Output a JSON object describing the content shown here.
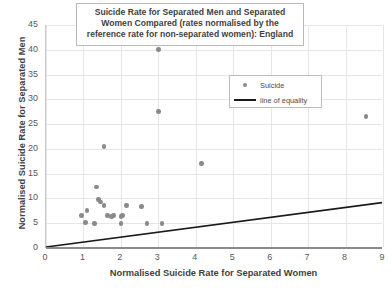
{
  "chart_data": {
    "type": "scatter",
    "title": "Suicide Rate for Separated Men and Separated Women Compared (rates normalised by the reference rate for non-separated women): England",
    "xlabel": "Normalised Suicide Rate for Separated Women",
    "ylabel": "Normalised Suicide Rate for Separated Men",
    "xlim": [
      0,
      9
    ],
    "ylim": [
      0,
      45
    ],
    "xticks": [
      0,
      1,
      2,
      3,
      4,
      5,
      6,
      7,
      8,
      9
    ],
    "yticks": [
      0,
      5,
      10,
      15,
      20,
      25,
      30,
      35,
      40,
      45
    ],
    "grid": true,
    "legend_position": "upper-right-inside",
    "series": [
      {
        "name": "Suicide",
        "type": "scatter",
        "color": "#8a8a8a",
        "points": [
          [
            3.0,
            40.0
          ],
          [
            3.0,
            27.5
          ],
          [
            8.55,
            26.5
          ],
          [
            4.15,
            17.0
          ],
          [
            1.55,
            20.5
          ],
          [
            1.35,
            12.3
          ],
          [
            1.4,
            9.8
          ],
          [
            1.45,
            9.3
          ],
          [
            1.55,
            8.6
          ],
          [
            2.15,
            8.6
          ],
          [
            2.55,
            8.4
          ],
          [
            1.1,
            7.6
          ],
          [
            0.95,
            6.5
          ],
          [
            1.05,
            5.2
          ],
          [
            1.65,
            6.6
          ],
          [
            1.75,
            6.3
          ],
          [
            1.8,
            6.5
          ],
          [
            2.0,
            6.4
          ],
          [
            2.05,
            6.6
          ],
          [
            1.3,
            5.0
          ],
          [
            2.0,
            4.9
          ],
          [
            2.7,
            4.9
          ],
          [
            3.1,
            5.0
          ]
        ]
      },
      {
        "name": "line of equality",
        "type": "line",
        "color": "#1a1a1a",
        "points": [
          [
            0,
            0
          ],
          [
            9,
            9
          ]
        ]
      }
    ]
  },
  "legend": {
    "items": [
      {
        "label": "Suicide",
        "marker": "dot-marker-icon"
      },
      {
        "label": "line of equality",
        "marker": "line-marker-icon"
      }
    ]
  }
}
